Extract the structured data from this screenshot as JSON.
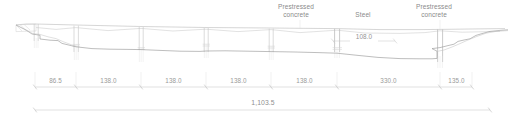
{
  "drawing": {
    "type": "bridge-elevation",
    "title": "",
    "units_note": "",
    "material_labels": [
      {
        "name": "prestressed-concrete-left",
        "line1": "Prestressed",
        "line2": "concrete",
        "x": 295,
        "y": 5
      },
      {
        "name": "steel",
        "line1": "Steel",
        "line2": "",
        "x": 363,
        "y": 14
      },
      {
        "name": "prestressed-concrete-right",
        "line1": "Prestressed",
        "line2": "concrete",
        "x": 433,
        "y": 5
      }
    ],
    "inner_dimension": {
      "label": "108.0",
      "x_start": 333,
      "x_end": 395,
      "y": 41
    },
    "span_dimension_line": {
      "y": 87,
      "x_start": 35,
      "x_end": 472,
      "ticks": [
        35,
        76,
        141,
        206,
        271,
        337,
        440,
        472
      ],
      "spans": [
        {
          "label": "86.5",
          "x_start": 35,
          "x_end": 76
        },
        {
          "label": "138.0",
          "x_start": 76,
          "x_end": 141
        },
        {
          "label": "138.0",
          "x_start": 141,
          "x_end": 206
        },
        {
          "label": "138.0",
          "x_start": 206,
          "x_end": 271
        },
        {
          "label": "138.0",
          "x_start": 271,
          "x_end": 337
        },
        {
          "label": "330.0",
          "x_start": 337,
          "x_end": 440
        },
        {
          "label": "135.0",
          "x_start": 440,
          "x_end": 472
        }
      ]
    },
    "total_dimension": {
      "label": "1,103.5",
      "x_start": 35,
      "x_end": 490,
      "y": 110
    },
    "colors": {
      "line": "#b8b8b8",
      "ground": "#8f8f8f",
      "deck": "#c9c9c9",
      "dimension": "#bdbdbd",
      "text": "#8d8d8d"
    },
    "piers": [
      {
        "name": "pier-abutment-left",
        "x": 36
      },
      {
        "name": "pier-1",
        "x": 76
      },
      {
        "name": "pier-2",
        "x": 141
      },
      {
        "name": "pier-3",
        "x": 206
      },
      {
        "name": "pier-4",
        "x": 271
      },
      {
        "name": "pier-main-left",
        "x": 337
      },
      {
        "name": "pier-main-right",
        "x": 440
      }
    ]
  }
}
